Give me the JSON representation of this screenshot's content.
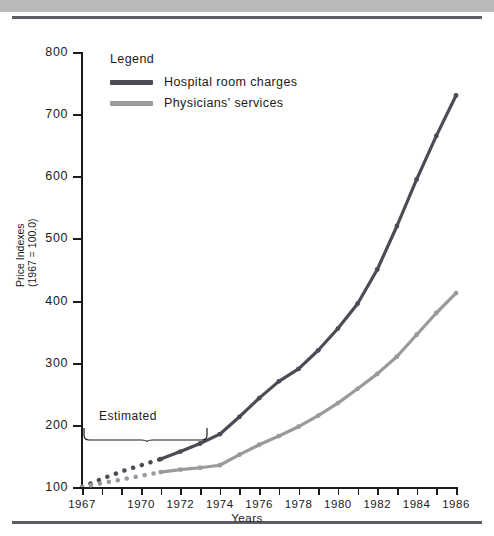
{
  "figure": {
    "axis_title_x": "Years",
    "axis_title_y_line1": "Price Indexes",
    "axis_title_y_line2": "(1967 = 100.0)",
    "estimated_label": "Estimated"
  },
  "legend": {
    "title": "Legend",
    "items": [
      {
        "label": "Hospital room charges",
        "color": "#4b4b55"
      },
      {
        "label": "Physicians' services",
        "color": "#9a9a9a"
      }
    ]
  },
  "colors": {
    "hospital": "#4b4b55",
    "physicians": "#9a9a9a",
    "axis": "#1b1b1b",
    "rule": "#5d5d66",
    "top_band": "#b9b9b9"
  },
  "chart_data": {
    "type": "line",
    "title": "",
    "xlabel": "Years",
    "ylabel": "Price Indexes (1967 = 100.0)",
    "xlim": [
      1967,
      1986
    ],
    "ylim": [
      100,
      800
    ],
    "yticks": [
      100,
      200,
      300,
      400,
      500,
      600,
      700,
      800
    ],
    "xticks": [
      1967,
      1968,
      1969,
      1970,
      1971,
      1972,
      1973,
      1974,
      1975,
      1976,
      1977,
      1978,
      1979,
      1980,
      1981,
      1982,
      1983,
      1984,
      1985,
      1986
    ],
    "xtick_labels": [
      1967,
      1970,
      1972,
      1974,
      1976,
      1978,
      1980,
      1982,
      1984,
      1986
    ],
    "grid": false,
    "legend_position": "upper left",
    "annotations": [
      {
        "text": "Estimated",
        "x_range": [
          1967,
          1971
        ],
        "style": "brace-below"
      }
    ],
    "estimated_range": [
      1967,
      1971
    ],
    "x": [
      1967,
      1968,
      1969,
      1970,
      1971,
      1972,
      1973,
      1974,
      1975,
      1976,
      1977,
      1978,
      1979,
      1980,
      1981,
      1982,
      1983,
      1984,
      1985,
      1986
    ],
    "series": [
      {
        "name": "Hospital room charges",
        "color": "#4b4b55",
        "values": [
          100,
          113,
          125,
          135,
          145,
          157,
          170,
          185,
          213,
          243,
          270,
          290,
          320,
          355,
          395,
          450,
          520,
          595,
          665,
          730
        ]
      },
      {
        "name": "Physicians' services",
        "color": "#9a9a9a",
        "values": [
          100,
          106,
          112,
          118,
          124,
          128,
          131,
          135,
          152,
          168,
          182,
          197,
          215,
          235,
          258,
          282,
          310,
          345,
          380,
          412
        ]
      }
    ]
  }
}
